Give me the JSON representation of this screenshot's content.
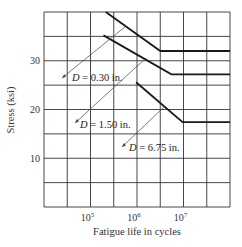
{
  "chart_data": {
    "type": "line",
    "title": "",
    "xlabel": "Fatigue life in cycles",
    "ylabel": "Stress (ksi)",
    "x_scale": "log10",
    "xlim_log10": [
      4,
      8
    ],
    "ylim": [
      0,
      40
    ],
    "grid": true,
    "x_ticks": [
      {
        "log": 5,
        "base": "10",
        "exp": "5"
      },
      {
        "log": 6,
        "base": "10",
        "exp": "6"
      },
      {
        "log": 7,
        "base": "10",
        "exp": "7"
      }
    ],
    "y_ticks": [
      {
        "value": 10,
        "label": "10"
      },
      {
        "value": 20,
        "label": "20"
      },
      {
        "value": 30,
        "label": "30"
      }
    ],
    "x_grid_log": [
      4,
      4.5,
      5,
      5.5,
      6,
      6.5,
      7,
      7.5,
      8
    ],
    "y_grid": [
      0,
      5,
      10,
      15,
      20,
      25,
      30,
      35,
      40
    ],
    "series": [
      {
        "name": "D = 0.30 in.",
        "label_var": "D",
        "label_rest": " = 0.30 in.",
        "points_log10": [
          [
            5.33,
            40
          ],
          [
            6.5,
            32
          ],
          [
            8,
            32
          ]
        ],
        "endurance_limit_ksi": 32,
        "label_pos": [
          72,
          81
        ],
        "leader": [
          [
            62,
            78
          ],
          [
            126,
            26
          ]
        ]
      },
      {
        "name": "D = 1.50 in.",
        "label_var": "D",
        "label_rest": " = 1.50 in.",
        "points_log10": [
          [
            5.28,
            35.2
          ],
          [
            6.74,
            27.2
          ],
          [
            8,
            27.2
          ]
        ],
        "endurance_limit_ksi": 27,
        "label_pos": [
          80,
          128
        ],
        "leader": [
          [
            75,
            123
          ],
          [
            146,
            58
          ]
        ]
      },
      {
        "name": "D = 6.75 in.",
        "label_var": "D",
        "label_rest": " = 6.75 in.",
        "points_log10": [
          [
            5.98,
            25.6
          ],
          [
            6.98,
            17.4
          ],
          [
            8,
            17.4
          ]
        ],
        "endurance_limit_ksi": 17.4,
        "label_pos": [
          129,
          151
        ],
        "leader": [
          [
            122,
            147
          ],
          [
            165,
            106
          ]
        ]
      }
    ]
  }
}
